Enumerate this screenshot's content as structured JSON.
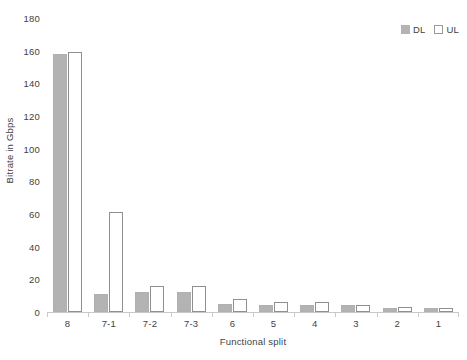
{
  "chart_data": {
    "type": "bar",
    "title": "",
    "xlabel": "Functional split",
    "ylabel": "Bitrate in Gbps",
    "categories": [
      "8",
      "7-1",
      "7-2",
      "7-3",
      "6",
      "5",
      "4",
      "3",
      "2",
      "1"
    ],
    "series": [
      {
        "name": "DL",
        "color": "#b3b3b3",
        "values": [
          158,
          11,
          12,
          12,
          5,
          4,
          4,
          4,
          2.5,
          2.5
        ]
      },
      {
        "name": "UL",
        "color": "#ffffff",
        "values": [
          159,
          61,
          16,
          16,
          8,
          6,
          6,
          4,
          3,
          2.5
        ]
      }
    ],
    "ylim": [
      0,
      180
    ],
    "yticks": [
      0,
      20,
      40,
      60,
      80,
      100,
      120,
      140,
      160,
      180
    ],
    "grid": false,
    "legend_position": "top-right"
  },
  "legend": {
    "entries": [
      {
        "label": "DL",
        "swatch": "filled-square-icon"
      },
      {
        "label": "UL",
        "swatch": "open-square-icon"
      }
    ]
  }
}
